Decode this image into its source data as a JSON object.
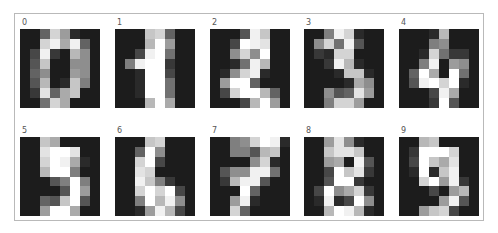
{
  "figure": {
    "panels": [
      {
        "label": "0",
        "pixels": [
          0,
          0,
          5,
          13,
          9,
          1,
          0,
          0,
          0,
          0,
          13,
          15,
          10,
          15,
          5,
          0,
          0,
          3,
          15,
          2,
          0,
          11,
          8,
          0,
          0,
          4,
          12,
          0,
          0,
          8,
          8,
          0,
          0,
          5,
          8,
          0,
          0,
          9,
          8,
          0,
          0,
          4,
          11,
          0,
          1,
          12,
          7,
          0,
          0,
          2,
          14,
          5,
          10,
          12,
          0,
          0,
          0,
          0,
          6,
          13,
          10,
          0,
          0,
          0
        ]
      },
      {
        "label": "1",
        "pixels": [
          0,
          0,
          0,
          12,
          13,
          5,
          0,
          0,
          0,
          0,
          0,
          11,
          16,
          9,
          0,
          0,
          0,
          0,
          3,
          15,
          16,
          6,
          0,
          0,
          0,
          7,
          15,
          16,
          16,
          2,
          0,
          0,
          0,
          0,
          1,
          16,
          16,
          3,
          0,
          0,
          0,
          0,
          1,
          16,
          16,
          6,
          0,
          0,
          0,
          0,
          1,
          16,
          16,
          6,
          0,
          0,
          0,
          0,
          0,
          11,
          16,
          10,
          0,
          0
        ]
      },
      {
        "label": "2",
        "pixels": [
          0,
          0,
          0,
          4,
          15,
          12,
          0,
          0,
          0,
          0,
          3,
          16,
          15,
          14,
          0,
          0,
          0,
          0,
          8,
          13,
          8,
          16,
          0,
          0,
          0,
          0,
          1,
          6,
          15,
          11,
          0,
          0,
          0,
          1,
          8,
          13,
          15,
          1,
          0,
          0,
          0,
          9,
          16,
          16,
          5,
          0,
          0,
          0,
          0,
          3,
          13,
          16,
          16,
          11,
          5,
          0,
          0,
          0,
          0,
          3,
          11,
          16,
          9,
          0
        ]
      },
      {
        "label": "3",
        "pixels": [
          0,
          0,
          7,
          15,
          13,
          1,
          0,
          0,
          0,
          8,
          13,
          6,
          15,
          4,
          0,
          0,
          0,
          2,
          1,
          13,
          13,
          0,
          0,
          0,
          0,
          0,
          2,
          15,
          11,
          1,
          0,
          0,
          0,
          0,
          0,
          1,
          12,
          12,
          1,
          0,
          0,
          0,
          0,
          0,
          1,
          10,
          8,
          0,
          0,
          0,
          8,
          4,
          5,
          14,
          9,
          0,
          0,
          0,
          7,
          13,
          13,
          9,
          0,
          0
        ]
      },
      {
        "label": "4",
        "pixels": [
          0,
          0,
          0,
          1,
          11,
          0,
          0,
          0,
          0,
          0,
          0,
          7,
          8,
          0,
          0,
          0,
          0,
          0,
          1,
          13,
          6,
          2,
          2,
          0,
          0,
          0,
          7,
          15,
          0,
          9,
          8,
          0,
          0,
          5,
          16,
          10,
          0,
          16,
          6,
          0,
          0,
          4,
          15,
          16,
          13,
          16,
          1,
          0,
          0,
          0,
          0,
          3,
          15,
          10,
          0,
          0,
          0,
          0,
          0,
          2,
          16,
          4,
          0,
          0
        ]
      },
      {
        "label": "5",
        "pixels": [
          0,
          0,
          12,
          10,
          0,
          0,
          0,
          0,
          0,
          0,
          14,
          16,
          16,
          14,
          0,
          0,
          0,
          0,
          13,
          16,
          15,
          10,
          1,
          0,
          0,
          0,
          11,
          16,
          16,
          7,
          0,
          0,
          0,
          0,
          0,
          4,
          7,
          16,
          7,
          0,
          0,
          0,
          0,
          0,
          4,
          16,
          9,
          0,
          0,
          0,
          5,
          4,
          12,
          16,
          4,
          0,
          0,
          0,
          9,
          16,
          16,
          10,
          0,
          0
        ]
      },
      {
        "label": "6",
        "pixels": [
          0,
          0,
          0,
          12,
          13,
          0,
          0,
          0,
          0,
          0,
          5,
          16,
          8,
          0,
          0,
          0,
          0,
          0,
          13,
          16,
          3,
          0,
          0,
          0,
          0,
          0,
          14,
          13,
          0,
          0,
          0,
          0,
          0,
          0,
          15,
          12,
          7,
          2,
          0,
          0,
          0,
          0,
          13,
          16,
          13,
          16,
          3,
          0,
          0,
          0,
          7,
          16,
          11,
          15,
          8,
          0,
          0,
          0,
          1,
          9,
          15,
          11,
          3,
          0
        ]
      },
      {
        "label": "7",
        "pixels": [
          0,
          0,
          7,
          8,
          13,
          16,
          15,
          1,
          0,
          0,
          7,
          7,
          4,
          11,
          12,
          0,
          0,
          0,
          0,
          0,
          8,
          13,
          1,
          0,
          0,
          4,
          8,
          8,
          15,
          15,
          6,
          0,
          0,
          2,
          11,
          15,
          15,
          4,
          0,
          0,
          0,
          0,
          0,
          16,
          5,
          0,
          0,
          0,
          0,
          0,
          9,
          15,
          1,
          0,
          0,
          0,
          0,
          0,
          13,
          5,
          0,
          0,
          0,
          0
        ]
      },
      {
        "label": "8",
        "pixels": [
          0,
          0,
          9,
          14,
          8,
          1,
          0,
          0,
          0,
          0,
          12,
          14,
          14,
          12,
          0,
          0,
          0,
          0,
          9,
          10,
          0,
          15,
          4,
          0,
          0,
          0,
          3,
          16,
          12,
          14,
          2,
          0,
          0,
          0,
          4,
          16,
          16,
          2,
          0,
          0,
          0,
          3,
          16,
          8,
          10,
          13,
          2,
          0,
          0,
          1,
          15,
          1,
          3,
          16,
          8,
          0,
          0,
          0,
          11,
          16,
          15,
          11,
          1,
          0
        ]
      },
      {
        "label": "9",
        "pixels": [
          0,
          0,
          11,
          12,
          0,
          0,
          0,
          0,
          0,
          2,
          16,
          16,
          16,
          13,
          0,
          0,
          0,
          3,
          16,
          12,
          10,
          14,
          0,
          0,
          0,
          1,
          16,
          1,
          12,
          15,
          0,
          0,
          0,
          0,
          13,
          16,
          9,
          15,
          2,
          0,
          0,
          0,
          0,
          3,
          0,
          9,
          11,
          0,
          0,
          0,
          0,
          0,
          9,
          15,
          4,
          0,
          0,
          0,
          9,
          12,
          13,
          3,
          0,
          0
        ]
      }
    ],
    "colormap": "gray",
    "value_max": 16,
    "grid": {
      "rows": 2,
      "cols": 5,
      "image_size": 8
    }
  }
}
